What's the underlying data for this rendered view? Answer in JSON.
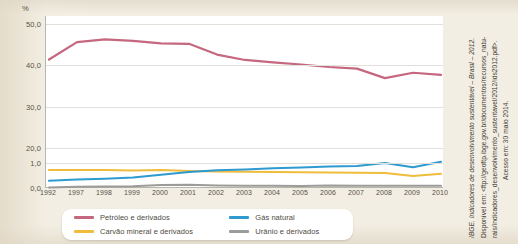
{
  "chart_data": {
    "type": "line",
    "title": "",
    "xlabel": "",
    "ylabel": "%",
    "axis_note": "broken y-axis: 0,0-1,0 compressed band below 20,0-50,0 band",
    "grid": true,
    "legend_position": "bottom",
    "categories": [
      "1992",
      "1997",
      "1998",
      "1999",
      "2000",
      "2001",
      "2002",
      "2003",
      "2004",
      "2005",
      "2006",
      "2007",
      "2008",
      "2009",
      "2010"
    ],
    "yticks": [
      "50,0",
      "40,0",
      "30,0",
      "20,0",
      "1,0",
      "0,0"
    ],
    "ylim_upper": [
      20.0,
      50.0
    ],
    "ylim_lower": [
      0.0,
      1.0
    ],
    "series": [
      {
        "name": "Petróleo e derivados",
        "color": "#c4677f",
        "values": [
          41.4,
          45.6,
          46.3,
          45.9,
          45.3,
          45.2,
          42.6,
          41.3,
          40.7,
          40.2,
          39.6,
          39.2,
          36.9,
          38.2,
          37.7
        ]
      },
      {
        "name": "Gás natural",
        "color": "#2e9ad0",
        "values": [
          0.29,
          0.34,
          0.37,
          0.42,
          0.53,
          0.64,
          0.71,
          0.74,
          0.79,
          0.82,
          0.86,
          0.88,
          1.0,
          0.83,
          1.05
        ]
      },
      {
        "name": "Carvão mineral e derivados",
        "color": "#f0bc3c",
        "values": [
          0.72,
          0.72,
          0.72,
          0.7,
          0.72,
          0.68,
          0.66,
          0.65,
          0.64,
          0.63,
          0.62,
          0.61,
          0.6,
          0.48,
          0.57
        ]
      },
      {
        "name": "Urânio e derivados",
        "color": "#9b9b99",
        "values": [
          0.02,
          0.05,
          0.06,
          0.07,
          0.12,
          0.13,
          0.1,
          0.09,
          0.09,
          0.08,
          0.1,
          0.09,
          0.09,
          0.09,
          0.09
        ]
      }
    ]
  },
  "axis": {
    "unit_label": "%",
    "y_labels": [
      "50,0",
      "40,0",
      "30,0",
      "20,0",
      "1,0",
      "0,0"
    ],
    "x_labels": [
      "1992",
      "1997",
      "1998",
      "1999",
      "2000",
      "2001",
      "2002",
      "2003",
      "2004",
      "2005",
      "2006",
      "2007",
      "2008",
      "2009",
      "2010"
    ]
  },
  "legend": {
    "items": [
      {
        "label": "Petróleo e derivados",
        "color": "#c4677f"
      },
      {
        "label": "Carvão mineral e derivados",
        "color": "#f0bc3c"
      },
      {
        "label": "Gás natural",
        "color": "#2e9ad0"
      },
      {
        "label": "Urânio e derivados",
        "color": "#9b9b99"
      }
    ]
  },
  "source": {
    "line1": "IBGE. Indicadores de desenvolvimento sustentável – Brasil – 2012.",
    "line2": "Disponível em: <ftp://geoftp.ibge.gov.br/documentos/recursos_natu-",
    "line3": "rais/indicadores_desenvolvimento_sustentavel/2012/ids2012.pdf>.",
    "line4": "Acesso em: 30 maio 2014."
  }
}
